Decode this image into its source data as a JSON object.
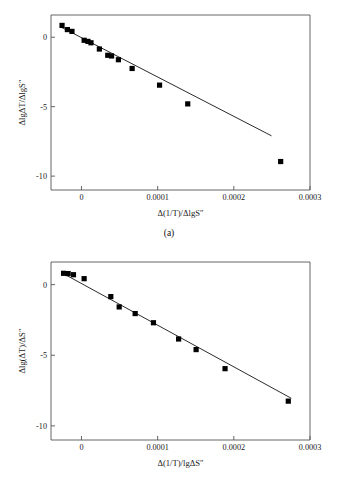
{
  "figure": {
    "panels": [
      {
        "caption": "(a)",
        "name": "panel-a"
      },
      {
        "caption": "(b)",
        "name": "panel-b"
      }
    ]
  },
  "chart_data": [
    {
      "type": "scatter",
      "panel": "(a)",
      "title": "",
      "xlabel": "Δ(1/T)/ΔlgS″",
      "ylabel": "ΔlgΔT/ΔlgS″",
      "xlabel_parts": {
        "delta": "Δ",
        "open": "(",
        "one_over_t": "1/T",
        "close": ")",
        "slash": "/",
        "delta2": "Δ",
        "lg": "lg",
        "s": "S",
        "dprime": "″"
      },
      "ylabel_parts": {
        "delta": "Δ",
        "lg": "lg",
        "delta2": "Δ",
        "t": "T",
        "slash": "/",
        "delta3": "Δ",
        "lg2": "lg",
        "s": "S",
        "dprime": "″"
      },
      "xlim": [
        -4e-05,
        0.0003
      ],
      "ylim": [
        -11.0,
        1.6
      ],
      "xticks": [
        0,
        0.0001,
        0.0002,
        0.0003
      ],
      "xtick_labels": [
        "0",
        "0.0001",
        "0.0002",
        "0.0003"
      ],
      "yticks": [
        0,
        -5,
        -10
      ],
      "ytick_labels": [
        "0",
        "-5",
        "-10"
      ],
      "grid": false,
      "legend": "none",
      "marker": "filled-square",
      "marker_color": "#000000",
      "line_color": "#2b2b2b",
      "points": [
        {
          "x": -2.55e-05,
          "y": 0.85
        },
        {
          "x": -1.85e-05,
          "y": 0.55
        },
        {
          "x": -1.25e-05,
          "y": 0.42
        },
        {
          "x": 3.5e-06,
          "y": -0.22
        },
        {
          "x": 8.5e-06,
          "y": -0.3
        },
        {
          "x": 1.25e-05,
          "y": -0.4
        },
        {
          "x": 2.35e-05,
          "y": -0.85
        },
        {
          "x": 3.45e-05,
          "y": -1.3
        },
        {
          "x": 3.95e-05,
          "y": -1.35
        },
        {
          "x": 4.85e-05,
          "y": -1.62
        },
        {
          "x": 6.65e-05,
          "y": -2.25
        },
        {
          "x": 0.0001025,
          "y": -3.45
        },
        {
          "x": 0.0001395,
          "y": -4.8
        },
        {
          "x": 0.0002615,
          "y": -8.95
        }
      ],
      "fit_line": {
        "x_start": -2.65e-05,
        "y_start": 0.72,
        "x_end": 0.0002495,
        "y_end": -7.1
      }
    },
    {
      "type": "scatter",
      "panel": "(b)",
      "title": "",
      "xlabel": "Δ(1/T)/lgΔS″",
      "ylabel": "Δlg(ΔT)/ΔS″",
      "xlabel_parts": {
        "delta": "Δ",
        "open": "(",
        "one_over_t": "1/T",
        "close": ")",
        "slash": "/",
        "lg": "lg",
        "delta2": "Δ",
        "s": "S",
        "dprime": "″"
      },
      "ylabel_parts": {
        "delta": "Δ",
        "lg": "lg",
        "open": "(",
        "delta2": "Δ",
        "t": "T",
        "close": ")",
        "slash": "/",
        "delta3": "Δ",
        "s": "S",
        "dprime": "″"
      },
      "xlim": [
        -4e-05,
        0.0003
      ],
      "ylim": [
        -11.0,
        1.6
      ],
      "xticks": [
        0,
        0.0001,
        0.0002,
        0.0003
      ],
      "xtick_labels": [
        "0",
        "0.0001",
        "0.0002",
        "0.0003"
      ],
      "yticks": [
        0,
        -5,
        -10
      ],
      "ytick_labels": [
        "0",
        "-5",
        "-10"
      ],
      "grid": false,
      "legend": "none",
      "marker": "filled-square",
      "marker_color": "#000000",
      "line_color": "#2b2b2b",
      "points": [
        {
          "x": -2.35e-05,
          "y": 0.8
        },
        {
          "x": -1.75e-05,
          "y": 0.78
        },
        {
          "x": -1.05e-05,
          "y": 0.7
        },
        {
          "x": 3.5e-06,
          "y": 0.42
        },
        {
          "x": 3.85e-05,
          "y": -0.85
        },
        {
          "x": 4.95e-05,
          "y": -1.58
        },
        {
          "x": 7.05e-05,
          "y": -2.05
        },
        {
          "x": 9.45e-05,
          "y": -2.7
        },
        {
          "x": 0.0001275,
          "y": -3.85
        },
        {
          "x": 0.0001505,
          "y": -4.6
        },
        {
          "x": 0.0001885,
          "y": -5.95
        },
        {
          "x": 0.0002715,
          "y": -8.25
        }
      ],
      "fit_line": {
        "x_start": -2.45e-05,
        "y_start": 0.8,
        "x_end": 0.0002755,
        "y_end": -8.05
      }
    }
  ]
}
